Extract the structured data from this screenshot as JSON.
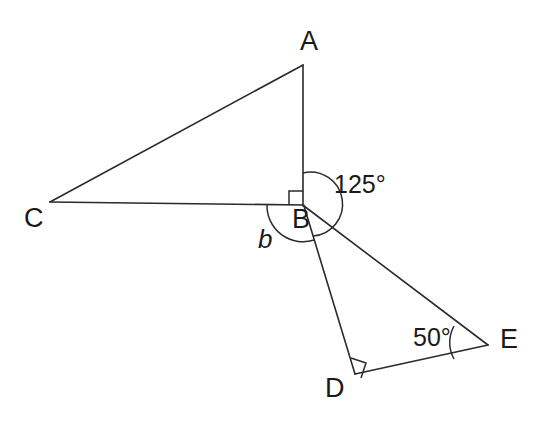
{
  "figure": {
    "background_color": "#ffffff",
    "line_color": "#2b2b2b",
    "text_color": "#1a1a1a",
    "width": 548,
    "height": 433,
    "vertices": [
      {
        "id": "A",
        "label": "A",
        "x": 303,
        "y": 65,
        "label_x": 300,
        "label_y": 28
      },
      {
        "id": "B",
        "label": "B",
        "x": 303,
        "y": 205,
        "label_x": 292,
        "label_y": 206
      },
      {
        "id": "C",
        "label": "C",
        "x": 50,
        "y": 202,
        "label_x": 24,
        "label_y": 205
      },
      {
        "id": "D",
        "label": "D",
        "x": 355,
        "y": 374,
        "label_x": 325,
        "label_y": 375
      },
      {
        "id": "E",
        "label": "E",
        "x": 488,
        "y": 345,
        "label_x": 500,
        "label_y": 326
      }
    ],
    "segments": [
      {
        "id": "CA",
        "from": "C",
        "to": "A"
      },
      {
        "id": "AB",
        "from": "A",
        "to": "B"
      },
      {
        "id": "CB",
        "from": "C",
        "to": "B"
      },
      {
        "id": "BE",
        "from": "B",
        "to": "E"
      },
      {
        "id": "BD",
        "from": "B",
        "to": "D"
      },
      {
        "id": "DE",
        "from": "D",
        "to": "E"
      }
    ],
    "right_angles": [
      {
        "id": "right-angle-B",
        "at": "B",
        "between": [
          "BA",
          "BC"
        ],
        "size": 14
      },
      {
        "id": "right-angle-D",
        "at": "D",
        "between": [
          "DB",
          "DE"
        ],
        "size": 15
      }
    ],
    "angle_marks": [
      {
        "id": "angle-ABE",
        "at": "B",
        "label": "125°",
        "label_x": 334,
        "label_y": 172,
        "radius": 32,
        "start_deg": -90,
        "end_deg": 72
      },
      {
        "id": "angle-CBD",
        "at": "B",
        "label": "b",
        "label_x": 258,
        "label_y": 226,
        "italic": true,
        "radius": 36,
        "start_deg": 180,
        "end_deg": 287
      },
      {
        "id": "angle-DEB",
        "at": "E",
        "label": "50°",
        "label_x": 413,
        "label_y": 325,
        "radius": 34,
        "start_deg": 168,
        "end_deg": 192
      }
    ]
  }
}
